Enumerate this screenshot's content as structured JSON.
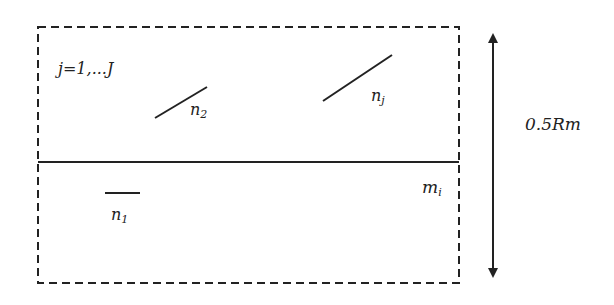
{
  "diagram": {
    "colors": {
      "stroke": "#222222",
      "background": "#ffffff"
    },
    "outer_box": {
      "style": "dashed",
      "x": 38,
      "y": 27,
      "width": 421,
      "height": 256
    },
    "divider": {
      "style": "solid",
      "y": 162
    },
    "labels": {
      "index_range": "j=1,...J",
      "region_upper": "",
      "region_lower": "m",
      "region_lower_sub": "i",
      "n1": "n",
      "n1_sub": "1",
      "n2": "n",
      "n2_sub": "2",
      "nj": "n",
      "nj_sub": "j",
      "dimension": "0.5Rm"
    },
    "segments": [
      {
        "name": "n1",
        "x1": 105,
        "y1": 193,
        "x2": 140,
        "y2": 193
      },
      {
        "name": "n2",
        "x1": 155,
        "y1": 118,
        "x2": 207,
        "y2": 87
      },
      {
        "name": "nj",
        "x1": 323,
        "y1": 101,
        "x2": 392,
        "y2": 55
      }
    ],
    "dimension_arrow": {
      "x": 493,
      "y_top": 28,
      "y_bottom": 283,
      "direction": "double-headed"
    }
  }
}
